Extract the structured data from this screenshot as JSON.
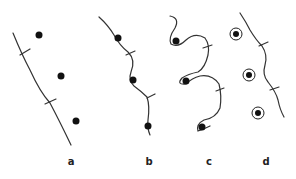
{
  "figure": {
    "panels": [
      {
        "label": "a",
        "x": 71,
        "description": "straight line with two ticks, three dots away from line"
      },
      {
        "label": "b",
        "x": 149,
        "description": "wavy line passing through three dots, two ticks"
      },
      {
        "label": "c",
        "x": 209,
        "description": "curled line looping around three dots, two ticks"
      },
      {
        "label": "d",
        "x": 266,
        "description": "wavy line with two ticks, three ringed dots away from line"
      }
    ]
  },
  "colors": {
    "ink": "#1a1a1a",
    "background": "#ffffff"
  }
}
